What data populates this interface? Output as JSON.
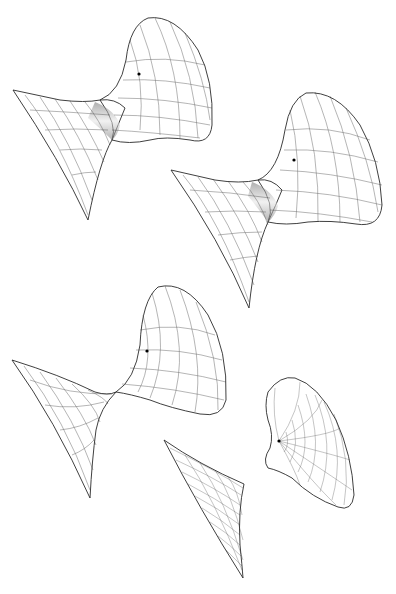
{
  "figure": {
    "background": "#ffffff",
    "shading": {
      "dark": "#3c3c3c",
      "mid": "#8a8a8a",
      "light": "#eeeeee",
      "mesh_line": "#333333",
      "marker": "#000000"
    },
    "surfaces": [
      {
        "id": 1,
        "label": "surface-1",
        "kind": "hyperboloid-like (wide neck)",
        "marker": {
          "x": 139,
          "y": 74
        }
      },
      {
        "id": 2,
        "label": "surface-2",
        "kind": "hyperboloid-like (narrower neck)",
        "marker": {
          "x": 294,
          "y": 160
        }
      },
      {
        "id": 3,
        "label": "surface-3",
        "kind": "pinched (cone point neck)",
        "marker": {
          "x": 147,
          "y": 351
        }
      },
      {
        "id": 4,
        "label": "surface-4",
        "kind": "separated lower sheet",
        "marker": null
      },
      {
        "id": 5,
        "label": "surface-5",
        "kind": "separated upper sheet",
        "marker": {
          "x": 279,
          "y": 441
        }
      }
    ]
  }
}
